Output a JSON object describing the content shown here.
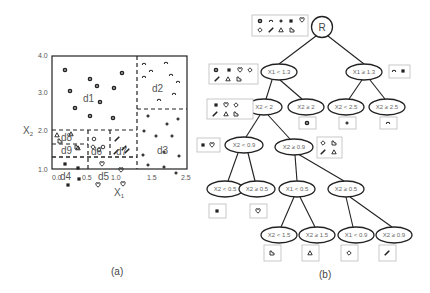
{
  "figure_a": {
    "caption": "(a)",
    "xlabel": "X1",
    "ylabel": "X2",
    "x_ticks": [
      "0.0",
      "0.5",
      "1.0",
      "1.5",
      "2.5"
    ],
    "y_ticks": [
      "4.0",
      "3.0",
      "2.0",
      "1.0"
    ],
    "regions": [
      "d1",
      "d2",
      "d3",
      "d4",
      "d5",
      "d6",
      "d7",
      "d8",
      "d9"
    ]
  },
  "figure_b": {
    "caption": "(b)",
    "root_label": "R",
    "nodes": {
      "n1": "X1 < 1.3",
      "n2": "X1 ≥ 1.3",
      "n3": "X2 < 2",
      "n4": "X2 ≥ 2",
      "n5": "X2 < 2.5",
      "n6": "X2 ≥ 2.5",
      "n7": "X2 < 0.9",
      "n8": "X2 ≥ 0.9",
      "n9": "X2 < 0.5",
      "n10": "X2 ≥ 0.5",
      "n11": "X1 < 0.5",
      "n12": "X2 ≥ 0.5",
      "n13": "X2 < 1.5",
      "n14": "X2 ≥ 1.5",
      "n15": "X1 < 0.9",
      "n16": "X2 ≥ 0.9"
    }
  }
}
